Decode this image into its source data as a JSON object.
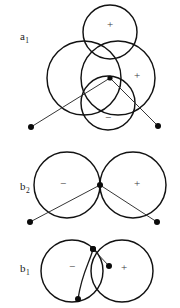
{
  "figure": {
    "background_color": "#ffffff",
    "stroke_color": "#121212",
    "panels": [
      {
        "id": "a1",
        "label": "a",
        "label_sub": "1",
        "label_x": 20,
        "label_y": 40,
        "circles": [
          {
            "name": "top-lobe",
            "cx": 110,
            "cy": 32,
            "r": 27,
            "sign": "+",
            "sign_x": 110,
            "sign_y": 25
          },
          {
            "name": "left-lobe",
            "cx": 84,
            "cy": 78,
            "r": 37,
            "sign": "",
            "sign_x": 0,
            "sign_y": 0
          },
          {
            "name": "right-lobe",
            "cx": 118,
            "cy": 78,
            "r": 37,
            "sign": "+",
            "sign_x": 137,
            "sign_y": 76
          },
          {
            "name": "bottom-lobe",
            "cx": 108,
            "cy": 103,
            "r": 27,
            "sign": "−",
            "sign_x": 108,
            "sign_y": 118
          }
        ],
        "node": {
          "name": "center-node",
          "x": 110,
          "y": 78,
          "r": 2.6
        },
        "bonds": [
          {
            "name": "bond-left",
            "x1": 110,
            "y1": 78,
            "x2": 31,
            "y2": 127
          },
          {
            "name": "bond-right",
            "x1": 110,
            "y1": 78,
            "x2": 158,
            "y2": 126
          }
        ],
        "atoms": [
          {
            "name": "atom-left",
            "x": 31,
            "y": 127,
            "r": 3.0
          },
          {
            "name": "atom-right",
            "x": 158,
            "y": 126,
            "r": 3.0
          }
        ],
        "curves": []
      },
      {
        "id": "b2",
        "label": "b",
        "label_sub": "2",
        "label_x": 20,
        "label_y": 190,
        "circles": [
          {
            "name": "left-lobe",
            "cx": 67,
            "cy": 185,
            "r": 33,
            "sign": "−",
            "sign_x": 63,
            "sign_y": 184
          },
          {
            "name": "right-lobe",
            "cx": 133,
            "cy": 185,
            "r": 33,
            "sign": "+",
            "sign_x": 137,
            "sign_y": 184
          }
        ],
        "node": {
          "name": "center-node",
          "x": 100,
          "y": 185,
          "r": 3.0
        },
        "bonds": [
          {
            "name": "bond-left",
            "x1": 100,
            "y1": 185,
            "x2": 30,
            "y2": 222
          },
          {
            "name": "bond-right",
            "x1": 100,
            "y1": 185,
            "x2": 157,
            "y2": 222
          }
        ],
        "atoms": [
          {
            "name": "atom-left",
            "x": 30,
            "y": 222,
            "r": 3.0
          },
          {
            "name": "atom-right",
            "x": 157,
            "y": 222,
            "r": 3.0
          }
        ],
        "curves": []
      },
      {
        "id": "b1",
        "label": "b",
        "label_sub": "1",
        "label_x": 20,
        "label_y": 272,
        "circles": [
          {
            "name": "left-lobe",
            "cx": 72,
            "cy": 271,
            "r": 31,
            "sign": "−",
            "sign_x": 72,
            "sign_y": 267
          },
          {
            "name": "right-lobe",
            "cx": 122,
            "cy": 271,
            "r": 31,
            "sign": "+",
            "sign_x": 124,
            "sign_y": 268
          }
        ],
        "node": {
          "name": "top-node",
          "x": 93,
          "y": 249,
          "r": 3.0
        },
        "bonds": [
          {
            "name": "bond-short",
            "x1": 93,
            "y1": 249,
            "x2": 109,
            "y2": 266
          }
        ],
        "atoms": [
          {
            "name": "atom-upper",
            "x": 93,
            "y": 249,
            "r": 3.0
          },
          {
            "name": "atom-mid",
            "x": 109,
            "y": 266,
            "r": 3.0
          },
          {
            "name": "atom-lower",
            "x": 78,
            "y": 299,
            "r": 3.0
          }
        ],
        "curves": [
          {
            "name": "bond-curve-down",
            "d": "M 93 249 C 90 262 82 272 78 299"
          }
        ]
      }
    ]
  }
}
